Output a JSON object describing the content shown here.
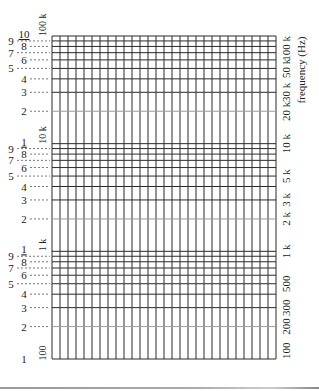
{
  "chart_data": {
    "type": "log-graph-paper",
    "title": "",
    "ylabel": "frequency (Hz)",
    "xlabel": "",
    "y_scale": "log",
    "ylim": [
      100,
      100000
    ],
    "decades": 3,
    "grid": true,
    "vertical_gridlines": 29,
    "left_axis": {
      "digit_labels": [
        "1",
        "2",
        "3",
        "4",
        "5",
        "6",
        "7",
        "8",
        "9",
        "10"
      ],
      "decade_labels": [
        {
          "value": 100,
          "label": "100"
        },
        {
          "value": 1000,
          "label": "1 k"
        },
        {
          "value": 10000,
          "label": "10 k"
        },
        {
          "value": 100000,
          "label": "100 k"
        }
      ]
    },
    "right_axis": {
      "ticks": [
        {
          "value": 100000,
          "label": "100 k"
        },
        {
          "value": 50000,
          "label": "50 k"
        },
        {
          "value": 30000,
          "label": "30 k"
        },
        {
          "value": 20000,
          "label": "20 k"
        },
        {
          "value": 10000,
          "label": "10 k"
        },
        {
          "value": 5000,
          "label": "5 k"
        },
        {
          "value": 3000,
          "label": "3 k"
        },
        {
          "value": 2000,
          "label": "2 k"
        },
        {
          "value": 1000,
          "label": "1 k"
        },
        {
          "value": 500,
          "label": "500"
        },
        {
          "value": 300,
          "label": "300"
        },
        {
          "value": 200,
          "label": "200"
        },
        {
          "value": 100,
          "label": "100"
        }
      ]
    },
    "colors": {
      "grid": "#2a2a2a",
      "grid_light": "#9a9a9a",
      "text": "#222222",
      "paper": "#ffffff"
    }
  }
}
